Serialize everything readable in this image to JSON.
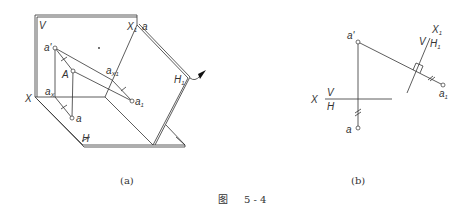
{
  "figure": {
    "caption_prefix": "图",
    "caption_number": "5 - 4",
    "subfig_a_label": "(a)",
    "subfig_b_label": "(b)"
  },
  "diagram_a": {
    "plane_V": "V",
    "plane_H": "H",
    "axis_X": "X",
    "axis_X1": "X",
    "axis_X1_sub": "1",
    "plane_H1": "H",
    "plane_H1_sub": "1",
    "point_A": "A",
    "point_a_prime": "a'",
    "point_a": "a",
    "point_ax": "a",
    "point_ax_sub": "X",
    "point_ax1": "a",
    "point_ax1_sub": "X1",
    "point_a1": "a",
    "point_a1_sub": "1",
    "label_a_top": "a"
  },
  "diagram_b": {
    "axis_X": "X",
    "plane_V": "V",
    "plane_H": "H",
    "axis_X1": "X",
    "axis_X1_sub": "1",
    "plane_V_new": "V",
    "plane_H1": "H",
    "plane_H1_sub": "1",
    "point_a_prime": "a'",
    "point_a": "a",
    "point_a1": "a",
    "point_a1_sub": "1"
  }
}
